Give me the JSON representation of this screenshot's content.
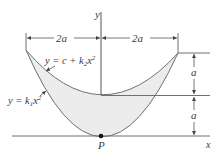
{
  "diagram": {
    "axes": {
      "x_label": "x",
      "y_label": "y"
    },
    "curves": {
      "outer": {
        "equation_prefix": "y = k",
        "sub": "1",
        "var": "x",
        "sup": "2"
      },
      "inner": {
        "equation_prefix": "y = c + k",
        "sub": "2",
        "var": "x",
        "sup": "2"
      }
    },
    "point": {
      "label": "P"
    },
    "dimensions": {
      "left_width": "2a",
      "right_width": "2a",
      "upper_height": "a",
      "lower_height": "a"
    },
    "colors": {
      "line": "#6e6e6e",
      "fill": "#ececec",
      "text": "#3a3a3a",
      "point": "#111111"
    }
  }
}
